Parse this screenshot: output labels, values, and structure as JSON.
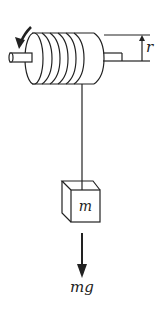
{
  "diagram": {
    "type": "physics-pulley-mass",
    "labels": {
      "radius": "r",
      "mass": "m",
      "force": "mg"
    },
    "components": {
      "cylinder": {
        "coils": 5,
        "rotation_arrow": "counterclockwise-down"
      },
      "string": "vertical",
      "block": "cube",
      "force_arrow": "downward"
    },
    "colors": {
      "stroke": "#222222",
      "background": "#ffffff"
    }
  }
}
